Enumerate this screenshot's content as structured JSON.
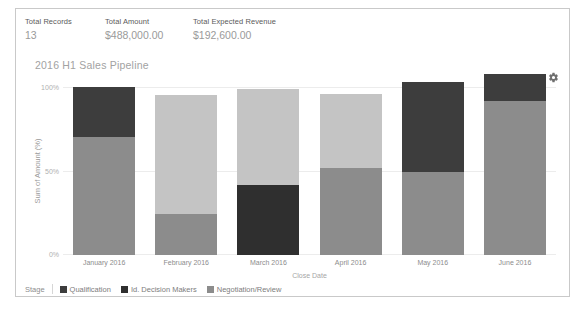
{
  "summary": {
    "metrics": [
      {
        "label": "Total Records",
        "value": "13"
      },
      {
        "label": "Total Amount",
        "value": "$488,000.00"
      },
      {
        "label": "Total Expected Revenue",
        "value": "$192,600.00"
      }
    ]
  },
  "chart_panel": {
    "title": "2016 H1 Sales Pipeline",
    "settings_icon": "gear-icon"
  },
  "legend": {
    "title": "Stage",
    "items": [
      {
        "label": "Qualification",
        "color": "#3d3d3d"
      },
      {
        "label": "Id. Decision Makers",
        "color": "#2f2f2f"
      },
      {
        "label": "Negotiation/Review",
        "color": "#8c8c8c"
      }
    ]
  },
  "chart_data": {
    "type": "bar",
    "stacked": true,
    "normalized": true,
    "title": "2016 H1 Sales Pipeline",
    "xlabel": "Close Date",
    "ylabel": "Sum of Amount (%)",
    "ylim": [
      0,
      100
    ],
    "yticks": [
      "0%",
      "50%",
      "100%"
    ],
    "ytick_values": [
      0,
      50,
      100
    ],
    "grid": true,
    "legend_position": "bottom",
    "categories": [
      "January 2016",
      "February 2016",
      "March 2016",
      "April 2016",
      "May 2016",
      "June 2016"
    ],
    "series": [
      {
        "name": "Qualification",
        "color": "#3d3d3d",
        "values": [
          30,
          0,
          0,
          0,
          52,
          15
        ]
      },
      {
        "name": "Id. Decision Makers",
        "color": "#2f2f2f",
        "values": [
          0,
          0,
          42,
          0,
          0,
          0
        ]
      },
      {
        "name": "Negotiation/Review",
        "color": "#8c8c8c",
        "values": [
          70,
          26,
          0,
          54,
          48,
          85
        ]
      },
      {
        "name": "Other",
        "color": "#c4c4c4",
        "values": [
          0,
          74,
          58,
          46,
          0,
          0
        ]
      }
    ],
    "bars": [
      {
        "category": "January 2016",
        "total_height_pct": 100,
        "segments": [
          {
            "stage": "Qualification",
            "value": 30,
            "color": "#3d3d3d"
          },
          {
            "stage": "Negotiation/Review",
            "value": 70,
            "color": "#8c8c8c"
          }
        ]
      },
      {
        "category": "February 2016",
        "total_height_pct": 95,
        "segments": [
          {
            "stage": "Other",
            "value": 74,
            "color": "#c4c4c4"
          },
          {
            "stage": "Negotiation/Review",
            "value": 26,
            "color": "#8c8c8c"
          }
        ]
      },
      {
        "category": "March 2016",
        "total_height_pct": 99,
        "segments": [
          {
            "stage": "Other",
            "value": 58,
            "color": "#c4c4c4"
          },
          {
            "stage": "Id. Decision Makers",
            "value": 42,
            "color": "#2f2f2f"
          }
        ]
      },
      {
        "category": "April 2016",
        "total_height_pct": 96,
        "segments": [
          {
            "stage": "Other",
            "value": 46,
            "color": "#c4c4c4"
          },
          {
            "stage": "Negotiation/Review",
            "value": 54,
            "color": "#8c8c8c"
          }
        ]
      },
      {
        "category": "May 2016",
        "total_height_pct": 103,
        "segments": [
          {
            "stage": "Qualification",
            "value": 52,
            "color": "#3d3d3d"
          },
          {
            "stage": "Negotiation/Review",
            "value": 48,
            "color": "#8c8c8c"
          }
        ]
      },
      {
        "category": "June 2016",
        "total_height_pct": 108,
        "segments": [
          {
            "stage": "Qualification",
            "value": 15,
            "color": "#3d3d3d"
          },
          {
            "stage": "Negotiation/Review",
            "value": 85,
            "color": "#8c8c8c"
          }
        ]
      }
    ]
  }
}
